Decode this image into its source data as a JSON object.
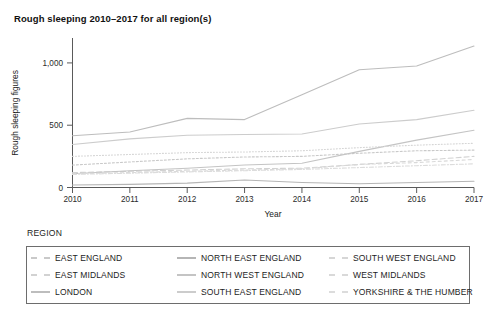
{
  "chart_data": {
    "type": "line",
    "title": "Rough sleeping 2010–2017 for all region(s)",
    "xlabel": "Year",
    "ylabel": "Rough sleeping figures",
    "x": [
      2010,
      2011,
      2012,
      2013,
      2014,
      2015,
      2016,
      2017
    ],
    "xtick_labels": [
      "2010",
      "2011",
      "2012",
      "2013",
      "2014",
      "2015",
      "2016",
      "2017"
    ],
    "ytick_labels": [
      "0",
      "500",
      "1,000"
    ],
    "ytick_values": [
      0,
      500,
      1000
    ],
    "ylim": [
      0,
      1200
    ],
    "xlim": [
      2010,
      2017
    ],
    "grid": false,
    "legend_position": "bottom",
    "legend_title": "REGION",
    "series": [
      {
        "name": "EAST ENGLAND",
        "color": "#c9c9c9",
        "dash": "2,2",
        "values": [
          180,
          205,
          230,
          245,
          250,
          275,
          295,
          300
        ]
      },
      {
        "name": "EAST MIDLANDS",
        "color": "#d2d2d2",
        "dash": "5,3",
        "values": [
          120,
          130,
          140,
          150,
          155,
          185,
          215,
          250
        ]
      },
      {
        "name": "LONDON",
        "color": "#bdbdbd",
        "dash": "none",
        "values": [
          415,
          445,
          555,
          545,
          745,
          945,
          975,
          1135
        ]
      },
      {
        "name": "NORTH EAST ENGLAND",
        "color": "#b5b5b5",
        "dash": "none",
        "values": [
          20,
          25,
          35,
          60,
          40,
          30,
          40,
          50
        ]
      },
      {
        "name": "NORTH WEST ENGLAND",
        "color": "#c4c4c4",
        "dash": "none",
        "values": [
          110,
          135,
          155,
          180,
          195,
          290,
          380,
          460
        ]
      },
      {
        "name": "SOUTH EAST ENGLAND",
        "color": "#cccccc",
        "dash": "none",
        "values": [
          345,
          390,
          420,
          425,
          430,
          510,
          545,
          620
        ]
      },
      {
        "name": "SOUTH WEST ENGLAND",
        "color": "#d6d6d6",
        "dash": "1,2",
        "values": [
          250,
          265,
          280,
          285,
          295,
          320,
          340,
          355
        ]
      },
      {
        "name": "WEST MIDLANDS",
        "color": "#d9d9d9",
        "dash": "3,3",
        "values": [
          110,
          120,
          130,
          140,
          150,
          185,
          200,
          225
        ]
      },
      {
        "name": "YORKSHIRE & THE HUMBER",
        "color": "#dcdcdc",
        "dash": "4,2,1,2",
        "values": [
          105,
          115,
          125,
          135,
          145,
          160,
          175,
          190
        ]
      }
    ]
  },
  "legend": {
    "heading": "REGION",
    "columns": [
      [
        {
          "label": "EAST ENGLAND",
          "series": 0
        },
        {
          "label": "EAST MIDLANDS",
          "series": 1
        },
        {
          "label": "LONDON",
          "series": 2
        }
      ],
      [
        {
          "label": "NORTH EAST ENGLAND",
          "series": 3
        },
        {
          "label": "NORTH WEST ENGLAND",
          "series": 4
        },
        {
          "label": "SOUTH EAST ENGLAND",
          "series": 5
        }
      ],
      [
        {
          "label": "SOUTH WEST ENGLAND",
          "series": 6
        },
        {
          "label": "WEST MIDLANDS",
          "series": 7
        },
        {
          "label": "YORKSHIRE & THE HUMBER",
          "series": 8
        }
      ]
    ]
  }
}
